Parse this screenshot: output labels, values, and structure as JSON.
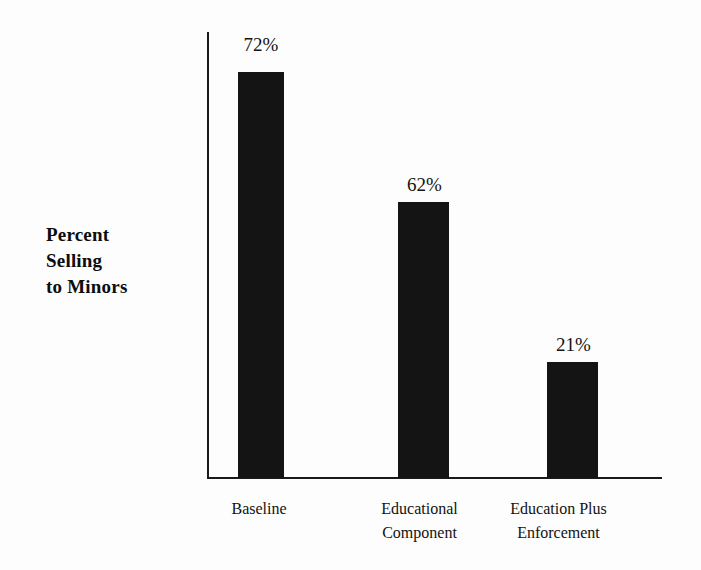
{
  "chart_data": {
    "type": "bar",
    "title": "",
    "xlabel": "",
    "ylabel": "Percent Selling to Minors",
    "ylim": [
      0,
      100
    ],
    "grid": false,
    "legend": false,
    "categories": [
      "Baseline",
      "Educational Component",
      "Education Plus Enforcement"
    ],
    "values": [
      72,
      62,
      21
    ],
    "value_labels": [
      "72%",
      "62%",
      "21%"
    ],
    "bar_color": "#141414",
    "background_color": "#fdfdfd",
    "axis_color": "#1a1a1a"
  },
  "axis_title": {
    "line1": "Percent",
    "line2": "Selling",
    "line3": "to Minors"
  },
  "bars": [
    {
      "label_line1": "Baseline",
      "label_line2": "",
      "value_label": "72%",
      "left": 238,
      "width": 46,
      "height": 406,
      "value_left": 222,
      "value_top": 34,
      "label_left": 205,
      "label_top": 497
    },
    {
      "label_line1": "Educational",
      "label_line2": "Component",
      "value_label": "62%",
      "left": 398,
      "width": 51,
      "height": 276,
      "value_left": 383,
      "value_top": 174,
      "label_left": 363,
      "label_top": 497
    },
    {
      "label_line1": "Education Plus",
      "label_line2": "Enforcement",
      "value_label": "21%",
      "left": 547,
      "width": 51,
      "height": 116,
      "value_left": 532,
      "value_top": 334,
      "label_left": 502,
      "label_top": 497
    }
  ]
}
